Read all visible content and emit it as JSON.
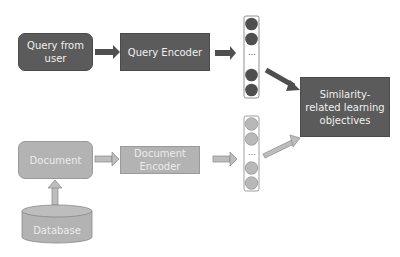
{
  "diagram": {
    "query_branch": {
      "input_label": "Query from user",
      "encoder_label": "Query Encoder",
      "vector_ellipsis": "..."
    },
    "document_branch": {
      "input_label": "Document",
      "encoder_label": "Document Encoder",
      "source_label": "Database",
      "vector_ellipsis": "..."
    },
    "objective_label": "Similarity-related learning objectives",
    "colors": {
      "dark": "#5b5b5b",
      "light": "#b3b3b3",
      "text_light": "#f0f0f0"
    }
  }
}
